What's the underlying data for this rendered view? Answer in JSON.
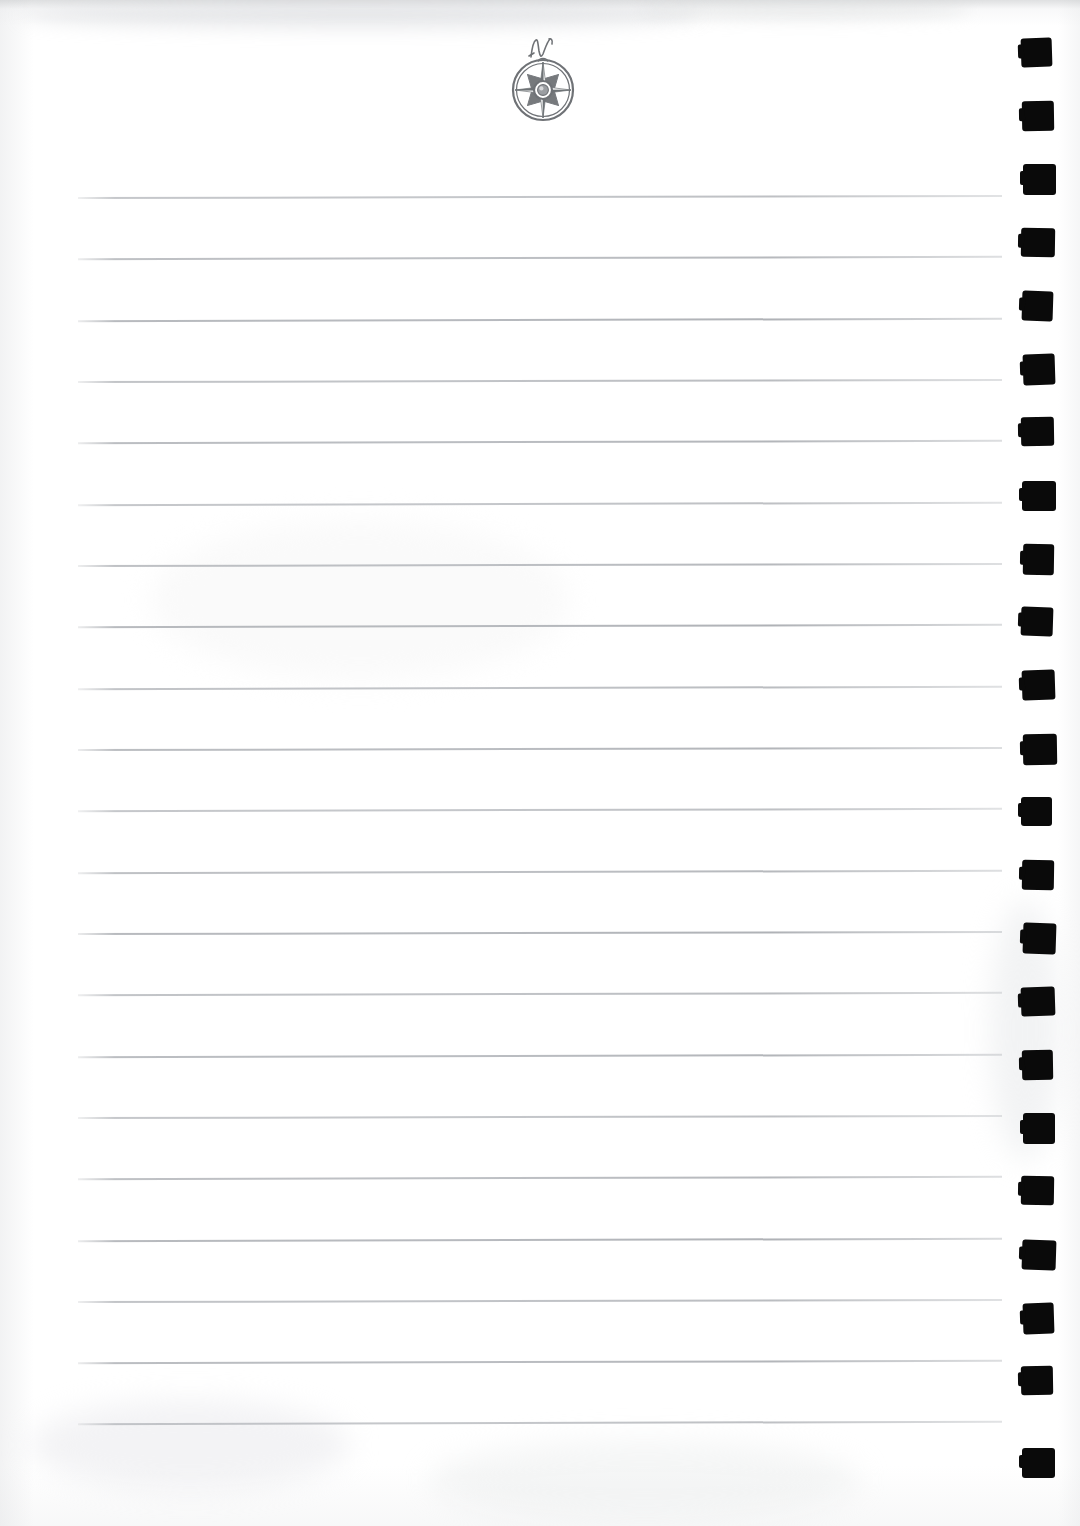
{
  "document": {
    "kind": "scanned-notebook-page",
    "page_width": 1080,
    "page_height": 1526,
    "paper_color": "#ffffff",
    "rule_color": "#aeb1b6",
    "mark_color": "#0a0a0a",
    "emblem": {
      "name": "compass-rose",
      "label": "N",
      "description": "eight-point compass rose in a double ring with a cursive N above the north point",
      "ink_color": "#6f7276",
      "center_x": 543,
      "center_y": 88,
      "diameter": 62
    },
    "ruled_lines": {
      "count": 21,
      "left_x": 78,
      "right_x": 1002,
      "first_y": 196,
      "spacing": 61.3,
      "y_positions": [
        196,
        257,
        319,
        380,
        441,
        503,
        564,
        625,
        687,
        748,
        809,
        871,
        932,
        993,
        1055,
        1116,
        1177,
        1239,
        1300,
        1361,
        1422
      ]
    },
    "binding_marks": {
      "count": 23,
      "left_x": 1022,
      "width": 32,
      "height": 30,
      "first_y": 38,
      "spacing": 63.2,
      "y_positions": [
        38,
        101,
        164,
        228,
        291,
        354,
        417,
        481,
        544,
        607,
        670,
        734,
        797,
        860,
        923,
        987,
        1050,
        1113,
        1176,
        1240,
        1303,
        1366,
        1448
      ]
    },
    "text_content": [],
    "notes": "blank ruled page, no handwriting or printed text"
  }
}
